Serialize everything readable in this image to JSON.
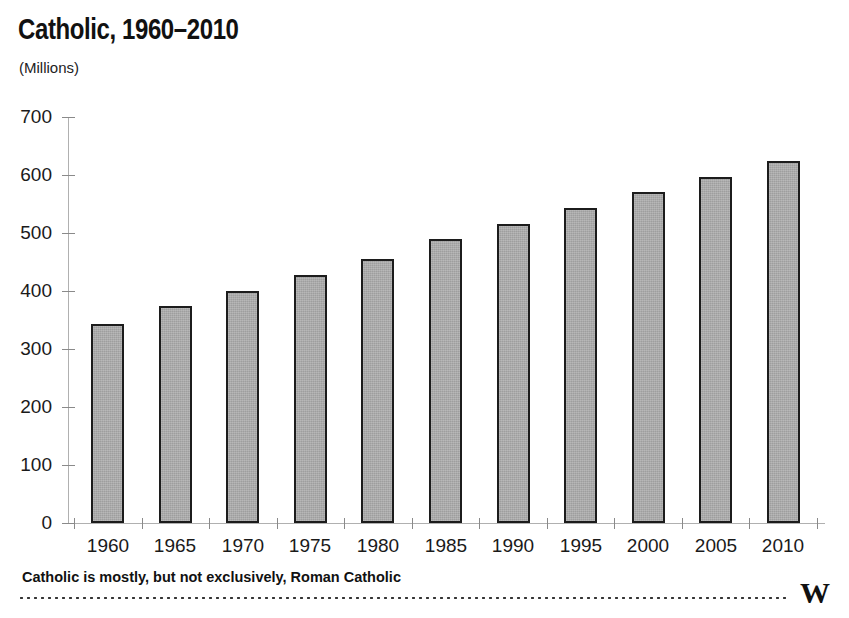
{
  "header": {
    "title": "Catholic, 1960–2010",
    "subtitle": "(Millions)"
  },
  "footer": {
    "note": "Catholic is mostly, but not exclusively, Roman Catholic",
    "logo": "W"
  },
  "chart_data": {
    "type": "bar",
    "title": "Catholic, 1960–2010",
    "subtitle": "(Millions)",
    "xlabel": "",
    "ylabel": "Millions",
    "categories": [
      "1960",
      "1965",
      "1970",
      "1975",
      "1980",
      "1985",
      "1990",
      "1995",
      "2000",
      "2005",
      "2010"
    ],
    "values": [
      343,
      374,
      400,
      428,
      456,
      490,
      516,
      543,
      570,
      597,
      624
    ],
    "ylim": [
      0,
      700
    ],
    "yticks": [
      0,
      100,
      200,
      300,
      400,
      500,
      600,
      700
    ],
    "ytick_labels": [
      "0",
      "100",
      "200",
      "300",
      "400",
      "500",
      "600",
      "700"
    ],
    "grid": false,
    "legend": null,
    "bar_fill_color": "#a9a9a9",
    "bar_border_color": "#1c1c1c",
    "axis_color": "#b0b0b0",
    "background_color": "#ffffff",
    "annotation": "Catholic is mostly, but not exclusively, Roman Catholic"
  }
}
